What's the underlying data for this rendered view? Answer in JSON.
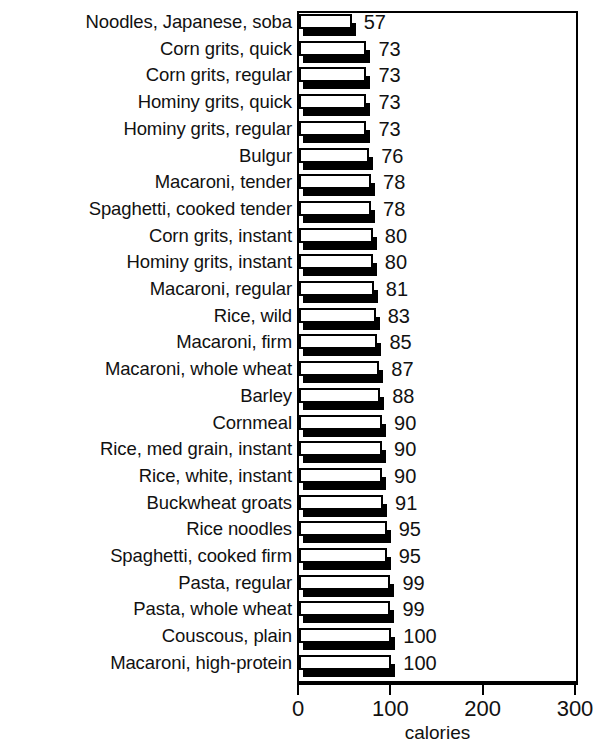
{
  "chart_data": {
    "type": "bar",
    "orientation": "horizontal",
    "title": "",
    "xlabel": "calories",
    "ylabel": "",
    "xlim": [
      0,
      300
    ],
    "xticks": [
      0,
      100,
      200,
      300
    ],
    "grid": false,
    "legend": null,
    "categories": [
      "Noodles, Japanese, soba",
      "Corn grits, quick",
      "Corn grits, regular",
      "Hominy grits, quick",
      "Hominy grits, regular",
      "Bulgur",
      "Macaroni, tender",
      "Spaghetti, cooked tender",
      "Corn grits, instant",
      "Hominy grits, instant",
      "Macaroni, regular",
      "Rice, wild",
      "Macaroni, firm",
      "Macaroni, whole wheat",
      "Barley",
      "Cornmeal",
      "Rice, med grain, instant",
      "Rice, white, instant",
      "Buckwheat groats",
      "Rice noodles",
      "Spaghetti, cooked firm",
      "Pasta, regular",
      "Pasta, whole wheat",
      "Couscous, plain",
      "Macaroni, high-protein"
    ],
    "values": [
      57,
      73,
      73,
      73,
      73,
      76,
      78,
      78,
      80,
      80,
      81,
      83,
      85,
      87,
      88,
      90,
      90,
      90,
      91,
      95,
      95,
      99,
      99,
      100,
      100
    ],
    "value_labels": [
      "57",
      "73",
      "73",
      "73",
      "73",
      "76",
      "78",
      "78",
      "80",
      "80",
      "81",
      "83",
      "85",
      "87",
      "88",
      "90",
      "90",
      "90",
      "91",
      "95",
      "95",
      "99",
      "99",
      "100",
      "100"
    ],
    "xtick_labels": [
      "0",
      "100",
      "200",
      "300"
    ]
  },
  "colors": {
    "bar_face": "#ffffff",
    "bar_outline": "#000000",
    "bar_shadow": "#000000",
    "axis": "#000000",
    "text": "#111111",
    "background": "#ffffff"
  }
}
